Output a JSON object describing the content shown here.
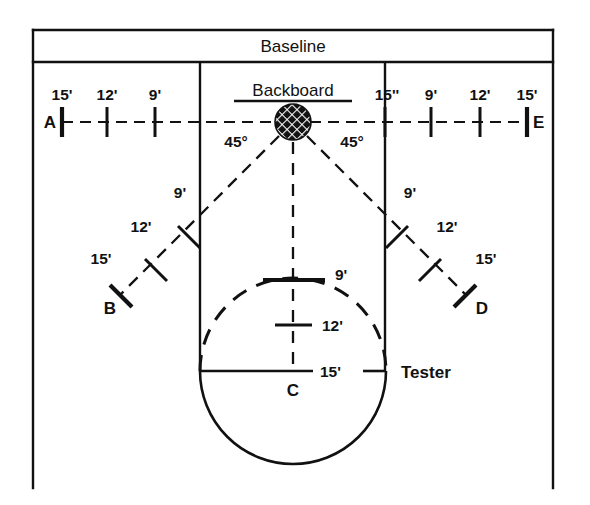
{
  "figure": {
    "title": "Baseline",
    "backboard_label": "Backboard",
    "tester_label": "Tester",
    "center_label": "C",
    "angle_left": "45°",
    "angle_right": "45°",
    "colors": {
      "ink": "#111111",
      "paper": "#ffffff"
    }
  },
  "axis_left": {
    "endpoint_label": "A",
    "ticks": [
      {
        "label": "15'"
      },
      {
        "label": "12'"
      },
      {
        "label": "9'"
      }
    ]
  },
  "axis_right": {
    "endpoint_label": "E",
    "ticks": [
      {
        "label": "15''"
      },
      {
        "label": "9'"
      },
      {
        "label": "12'"
      },
      {
        "label": "15'"
      }
    ]
  },
  "diagonal_left": {
    "endpoint_label": "B",
    "ticks": [
      {
        "label": "9'"
      },
      {
        "label": "12'"
      },
      {
        "label": "15'"
      }
    ]
  },
  "diagonal_right": {
    "endpoint_label": "D",
    "ticks": [
      {
        "label": "9'"
      },
      {
        "label": "12'"
      },
      {
        "label": "15'"
      }
    ]
  },
  "axis_center": {
    "endpoint_label": "C",
    "ticks": [
      {
        "label": "9'"
      },
      {
        "label": "12'"
      },
      {
        "label": "15'"
      }
    ]
  }
}
